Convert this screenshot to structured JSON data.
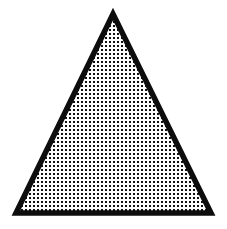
{
  "image": {
    "width": 227,
    "height": 229,
    "background_color": "#ffffff",
    "description": "Black-outlined triangle filled with a dense dotted halftone texture"
  },
  "figure": {
    "name": "dotted-triangle",
    "shape": "triangle",
    "vertices": {
      "apex": {
        "x": 113,
        "y": 14
      },
      "bottom_left": {
        "x": 16,
        "y": 213
      },
      "bottom_right": {
        "x": 211,
        "y": 213
      }
    },
    "points_attr": "113,14 211,213 16,213",
    "outline": {
      "color": "#0d0d0d",
      "width": 5.5,
      "join": "miter",
      "miterlimit": 12
    },
    "fill": {
      "base_color": "#ffffff",
      "pattern": {
        "type": "dot-grid",
        "dot_color": "#111111",
        "dot_shape": "square",
        "dot_size": 2.1,
        "spacing_x": 4,
        "spacing_y": 4,
        "offset_x": 0.95,
        "offset_y": 0.95
      }
    }
  }
}
